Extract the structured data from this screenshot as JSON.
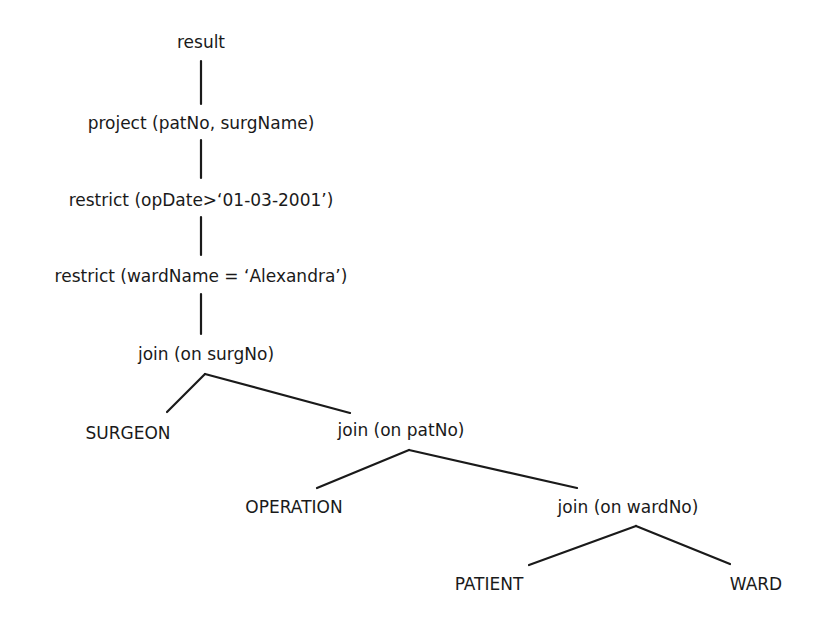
{
  "diagram": {
    "type": "relational algebra tree",
    "nodes": [
      {
        "id": "result",
        "label": "result"
      },
      {
        "id": "project",
        "label": "project (patNo, surgName)"
      },
      {
        "id": "restrict1",
        "label": "restrict (opDate>‘01-03-2001’)"
      },
      {
        "id": "restrict2",
        "label": "restrict (wardName = ‘Alexandra’)"
      },
      {
        "id": "join1",
        "label": "join (on surgNo)"
      },
      {
        "id": "surgeon",
        "label": "SURGEON"
      },
      {
        "id": "join2",
        "label": "join (on patNo)"
      },
      {
        "id": "operation",
        "label": "OPERATION"
      },
      {
        "id": "join3",
        "label": "join (on wardNo)"
      },
      {
        "id": "patient",
        "label": "PATIENT"
      },
      {
        "id": "ward",
        "label": "WARD"
      }
    ],
    "edges": [
      [
        "result",
        "project"
      ],
      [
        "project",
        "restrict1"
      ],
      [
        "restrict1",
        "restrict2"
      ],
      [
        "restrict2",
        "join1"
      ],
      [
        "join1",
        "surgeon"
      ],
      [
        "join1",
        "join2"
      ],
      [
        "join2",
        "operation"
      ],
      [
        "join2",
        "join3"
      ],
      [
        "join3",
        "patient"
      ],
      [
        "join3",
        "ward"
      ]
    ]
  }
}
